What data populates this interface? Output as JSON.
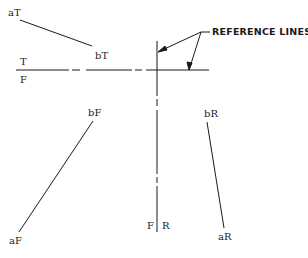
{
  "diagram": {
    "type": "orthographic projection of a line in three views",
    "callout": {
      "label": "REFERENCE LINES"
    },
    "reference_lines": {
      "horizontal": {
        "labels_above_below": [
          "T",
          "F"
        ]
      },
      "vertical": {
        "labels_left_right": [
          "F",
          "R"
        ]
      }
    },
    "points": {
      "aT": "aT",
      "bT": "bT",
      "bF": "bF",
      "aF": "aF",
      "bR": "bR",
      "aR": "aR"
    },
    "plane_labels": {
      "T": "T",
      "F_top": "F",
      "F_side": "F",
      "R": "R"
    },
    "colors": {
      "line": "#1a1a1a",
      "background": "#ffffff"
    }
  }
}
